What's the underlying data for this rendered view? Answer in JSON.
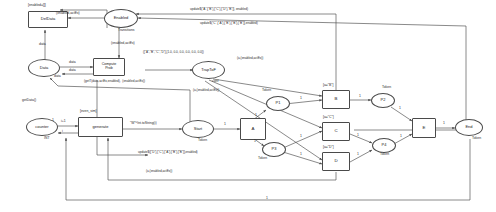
{
  "diagram": {
    "type": "colored-petri-net",
    "stroke_color": "#4a4a4a",
    "text_color": "#2a2a2a",
    "background": "#ffffff"
  },
  "places": [
    {
      "id": "enabled",
      "label": "Enabled",
      "shape": "ellipse",
      "type_label": "Transitions",
      "marking": ""
    },
    {
      "id": "data",
      "label": "Data",
      "shape": "ellipse",
      "type_label": "",
      "marking": ""
    },
    {
      "id": "traptof",
      "label": "TrapToF",
      "shape": "ellipse",
      "type_label": "",
      "marking": ""
    },
    {
      "id": "counter",
      "label": "counter",
      "shape": "ellipse",
      "type_label": "INT",
      "marking": ""
    },
    {
      "id": "start",
      "label": "Start",
      "shape": "ellipse",
      "type_label": "Token",
      "marking": ""
    },
    {
      "id": "p1",
      "label": "P1",
      "shape": "ellipse",
      "type_label": "Token",
      "marking": ""
    },
    {
      "id": "p2",
      "label": "P2",
      "shape": "ellipse",
      "type_label": "Token",
      "marking": ""
    },
    {
      "id": "p3",
      "label": "P3",
      "shape": "ellipse",
      "type_label": "Token",
      "marking": ""
    },
    {
      "id": "p4",
      "label": "P4",
      "shape": "ellipse",
      "type_label": "Token",
      "marking": ""
    },
    {
      "id": "end",
      "label": "End",
      "shape": "ellipse",
      "type_label": "Token",
      "marking": ""
    }
  ],
  "transitions": [
    {
      "id": "deldata",
      "label": "DelData",
      "guard": "[enabled=[]]"
    },
    {
      "id": "compute",
      "label": "Compute\nProb",
      "guard": ""
    },
    {
      "id": "generate",
      "label": "generate",
      "guard": "[even_sim]"
    },
    {
      "id": "a",
      "label": "A",
      "guard": ""
    },
    {
      "id": "b",
      "label": "B",
      "guard": "[a=\"B\"]"
    },
    {
      "id": "c",
      "label": "C",
      "guard": "[a=\"C\"]"
    },
    {
      "id": "d",
      "label": "D",
      "guard": "[a=\"D\"]"
    },
    {
      "id": "e",
      "label": "E",
      "guard": ""
    }
  ],
  "arc_labels": [
    {
      "id": "al_enabled_del",
      "text": "(enabled,actEx)"
    },
    {
      "id": "al_data_del",
      "text": "data"
    },
    {
      "id": "al_data_cp1",
      "text": "data"
    },
    {
      "id": "al_data_cp2",
      "text": "data"
    },
    {
      "id": "al_data_back",
      "text": "data"
    },
    {
      "id": "al_enabled_cp",
      "text": "(enabled,actEx)"
    },
    {
      "id": "al_getdata",
      "text": "getData()"
    },
    {
      "id": "al_compute_out",
      "text": "(getT(data,actEx,enabled),  (enabled,actEx))"
    },
    {
      "id": "al_probvec",
      "text": "([\"A\",\"B\",\"C\",\"D\"],[1.0, 0.0, 0.0, 0.0, 0.0, 0.0])"
    },
    {
      "id": "al_traptof_conf",
      "text": "conf"
    },
    {
      "id": "al_traptof_a",
      "text": "(a,(enabled,actEx))"
    },
    {
      "id": "al_traptof_a2",
      "text": "(a,(enabled,actEx))"
    },
    {
      "id": "al_traptof_a3",
      "text": "(a,(enabled,actEx))"
    },
    {
      "id": "al_traptof_a4",
      "text": "(a,(enabled,actEx))"
    },
    {
      "id": "al_update_b",
      "text": "update$(\"A\",[\"B\"],[\"C\"],[\"D\"],\"B\"]], enabled)"
    },
    {
      "id": "al_update_c",
      "text": "update$(\"C\",[\"A\"],[\"B\"],[\"B\"],[\"B\"]],enabled)"
    },
    {
      "id": "al_update_d",
      "text": "update$([\"D\"],[\"C\"],[\"A\"],[\"B\"],[\"B\"]],enabled)"
    },
    {
      "id": "al_counter_i1",
      "text": "i+1"
    },
    {
      "id": "al_counter_i2",
      "text": "i"
    },
    {
      "id": "al_gen_out",
      "text": "\"W\"^Int.toString(i)"
    },
    {
      "id": "al_one",
      "text": "1"
    }
  ],
  "arc_weights": {
    "start_a": "1",
    "a_p1": "1",
    "a_p3": "1",
    "p1_b": "1",
    "b_p2": "1",
    "p3_c": "1",
    "p3_d": "1",
    "c_p4": "1",
    "d_p4": "1",
    "p2_e": "1",
    "p4_e": "1",
    "e_end": "1",
    "end_back": "1",
    "counter_gen": "1"
  }
}
